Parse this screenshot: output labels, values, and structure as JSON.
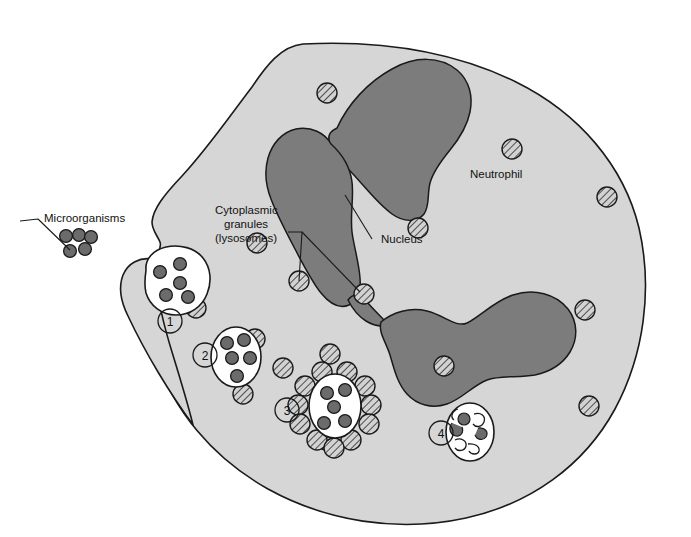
{
  "figure": {
    "title_semantic": "neutrophil-phagocytosis-diagram",
    "background_color": "#ffffff"
  },
  "colors": {
    "cytoplasm": "#d6d6d6",
    "nucleus": "#7c7c7c",
    "outline": "#1a1a1a",
    "granule_fill": "#d0d0d0",
    "granule_hatch": "#3a3a3a",
    "microorganism": "#6b6b6b",
    "vesicle_fill": "#ffffff",
    "text": "#111111"
  },
  "labels": {
    "microorganisms": "Microorganisms",
    "cytoplasmic_granules_line1": "Cytoplasmic",
    "cytoplasmic_granules_line2": "granules",
    "cytoplasmic_granules_line3": "(lysosomes)",
    "nucleus": "Nucleus",
    "neutrophil": "Neutrophil"
  },
  "stages": [
    {
      "number": "1",
      "name": "engulfment-pseudopod",
      "cx": 170,
      "cy": 321,
      "microorganism_count": 5
    },
    {
      "number": "2",
      "name": "phagosome-formed",
      "cx": 205,
      "cy": 355,
      "microorganism_count": 5
    },
    {
      "number": "3",
      "name": "lysosome-fusion",
      "cx": 287,
      "cy": 410,
      "microorganism_count": 5,
      "surrounding_granules": 12
    },
    {
      "number": "4",
      "name": "digestion-residual-body",
      "cx": 441,
      "cy": 433,
      "microorganism_count": 1
    }
  ],
  "free_microorganisms": {
    "count": 5,
    "positions": [
      {
        "cx": 66,
        "cy": 236
      },
      {
        "cx": 79,
        "cy": 235
      },
      {
        "cx": 91,
        "cy": 237
      },
      {
        "cx": 70,
        "cy": 251
      },
      {
        "cx": 85,
        "cy": 249
      }
    ]
  },
  "cytoplasmic_granules": {
    "radius": 10,
    "positions": [
      {
        "cx": 327,
        "cy": 93
      },
      {
        "cx": 512,
        "cy": 149
      },
      {
        "cx": 257,
        "cy": 243
      },
      {
        "cx": 196,
        "cy": 308
      },
      {
        "cx": 255,
        "cy": 339
      },
      {
        "cx": 418,
        "cy": 228
      },
      {
        "cx": 607,
        "cy": 197
      },
      {
        "cx": 299,
        "cy": 281
      },
      {
        "cx": 364,
        "cy": 294
      },
      {
        "cx": 243,
        "cy": 394
      },
      {
        "cx": 326,
        "cy": 440
      },
      {
        "cx": 444,
        "cy": 366
      },
      {
        "cx": 585,
        "cy": 310
      },
      {
        "cx": 589,
        "cy": 406
      },
      {
        "cx": 330,
        "cy": 354
      }
    ]
  },
  "stage3_ring_granules": [
    {
      "cx": 322,
      "cy": 372
    },
    {
      "cx": 347,
      "cy": 372
    },
    {
      "cx": 305,
      "cy": 386
    },
    {
      "cx": 365,
      "cy": 386
    },
    {
      "cx": 298,
      "cy": 405
    },
    {
      "cx": 371,
      "cy": 405
    },
    {
      "cx": 300,
      "cy": 424
    },
    {
      "cx": 369,
      "cy": 424
    },
    {
      "cx": 317,
      "cy": 440
    },
    {
      "cx": 351,
      "cy": 440
    },
    {
      "cx": 334,
      "cy": 448
    },
    {
      "cx": 283,
      "cy": 368
    }
  ]
}
